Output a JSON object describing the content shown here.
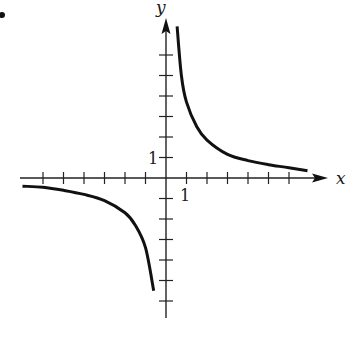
{
  "chart_data": {
    "type": "line",
    "title": "",
    "xlabel": "x",
    "ylabel": "y",
    "xlim": [
      -7,
      7
    ],
    "ylim": [
      -7,
      7
    ],
    "grid": false,
    "tick_spacing": 1,
    "tick_labels": [
      {
        "axis": "y",
        "value": 1,
        "text": "1"
      },
      {
        "axis": "x",
        "value": 1,
        "text": "1"
      }
    ],
    "series": [
      {
        "name": "branch-quadrant-1",
        "description": "hyperbola branch approaching both axes, approx y = 3.6/x for x > 0",
        "x": [
          0.54,
          0.75,
          1,
          1.5,
          2,
          3,
          4,
          5,
          6,
          6.9
        ],
        "y": [
          7.4,
          5.0,
          3.7,
          2.5,
          1.85,
          1.15,
          0.85,
          0.65,
          0.5,
          0.35
        ]
      },
      {
        "name": "branch-quadrant-3",
        "description": "hyperbola branch in third quadrant, approx y = -3/x for x < 0",
        "x": [
          -7.0,
          -6.0,
          -5.0,
          -4.0,
          -3.0,
          -2.0,
          -1.5,
          -1.0,
          -0.6
        ],
        "y": [
          -0.4,
          -0.45,
          -0.6,
          -0.8,
          -1.1,
          -1.7,
          -2.3,
          -3.4,
          -5.5
        ]
      }
    ]
  },
  "labels": {
    "x_axis": "x",
    "y_axis": "y",
    "y_tick_one": "1",
    "x_tick_one": "1"
  },
  "marker": {
    "bullet": "•"
  }
}
